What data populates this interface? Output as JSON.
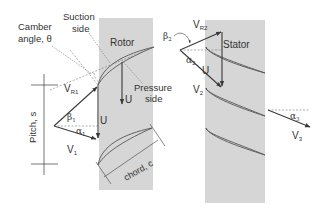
{
  "diagram": {
    "type": "turbomachinery velocity triangles (rotor-stator stage)",
    "colors": {
      "region_fill": "#d6d6d6",
      "line": "#3a3a3a",
      "dashed": "#777777",
      "text": "#333333",
      "background": "#ffffff"
    },
    "regions": {
      "rotor": {
        "label": "Rotor"
      },
      "stator": {
        "label": "Stator"
      }
    },
    "labels": {
      "camber_angle": [
        "Camber",
        "angle, θ"
      ],
      "suction_side": [
        "Suction",
        "side"
      ],
      "pressure_side": [
        "Pressure",
        "side"
      ],
      "pitch": "Pitch, s",
      "chord": "chord, c"
    },
    "inlet_triangle": {
      "v_r1": "V",
      "v_r1_sub": "R1",
      "v_1": "V",
      "v_1_sub": "1",
      "u": "U",
      "beta_1": "β",
      "beta_1_sub": "1",
      "alpha_1": "α",
      "alpha_1_sub": "1"
    },
    "rotor_u_label": "U",
    "exit_triangle": {
      "v_r2": "V",
      "v_r2_sub": "R2",
      "v_2": "V",
      "v_2_sub": "2",
      "u": "U",
      "beta_2": "β",
      "beta_2_sub": "2",
      "alpha_2": "α",
      "alpha_2_sub": "2"
    },
    "stator_outlet": {
      "v_3": "V",
      "v_3_sub": "3",
      "alpha_3": "α",
      "alpha_3_sub": "3"
    }
  }
}
